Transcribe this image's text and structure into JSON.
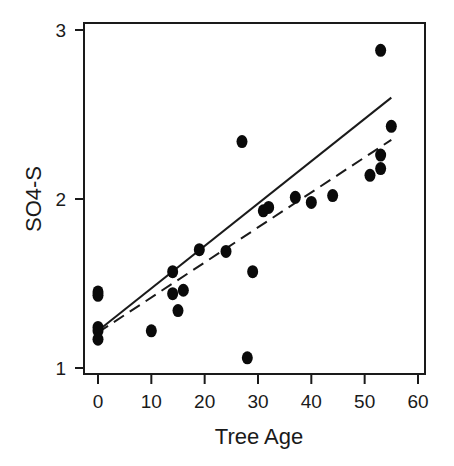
{
  "chart_data": {
    "type": "scatter",
    "title": "",
    "xlabel": "Tree Age",
    "ylabel": "SO4-S",
    "xlim": [
      -2.6,
      61.5
    ],
    "ylim": [
      0.96,
      3.04
    ],
    "xticks": [
      0,
      10,
      20,
      30,
      40,
      50,
      60
    ],
    "yticks": [
      1,
      2,
      3
    ],
    "grid": false,
    "legend": null,
    "points": [
      {
        "x": 0,
        "y": 1.45
      },
      {
        "x": 0,
        "y": 1.43
      },
      {
        "x": 0,
        "y": 1.24
      },
      {
        "x": 0,
        "y": 1.22
      },
      {
        "x": 0,
        "y": 1.17
      },
      {
        "x": 10,
        "y": 1.22
      },
      {
        "x": 14,
        "y": 1.57
      },
      {
        "x": 14,
        "y": 1.44
      },
      {
        "x": 15,
        "y": 1.34
      },
      {
        "x": 16,
        "y": 1.46
      },
      {
        "x": 19,
        "y": 1.7
      },
      {
        "x": 24,
        "y": 1.69
      },
      {
        "x": 27,
        "y": 2.34
      },
      {
        "x": 28,
        "y": 1.06
      },
      {
        "x": 29,
        "y": 1.57
      },
      {
        "x": 31,
        "y": 1.93
      },
      {
        "x": 32,
        "y": 1.95
      },
      {
        "x": 37,
        "y": 2.01
      },
      {
        "x": 40,
        "y": 1.98
      },
      {
        "x": 44,
        "y": 2.02
      },
      {
        "x": 51,
        "y": 2.14
      },
      {
        "x": 53,
        "y": 2.18
      },
      {
        "x": 53,
        "y": 2.26
      },
      {
        "x": 53,
        "y": 2.88
      },
      {
        "x": 55,
        "y": 2.43
      }
    ],
    "lines": [
      {
        "name": "solid-fit",
        "style": "solid",
        "x": [
          0,
          55
        ],
        "y": [
          1.22,
          2.6
        ]
      },
      {
        "name": "dashed-fit",
        "style": "dashed",
        "x": [
          0,
          55
        ],
        "y": [
          1.21,
          2.35
        ]
      }
    ]
  },
  "labels": {
    "xlabel": "Tree Age",
    "ylabel": "SO4-S",
    "xticks": [
      "0",
      "10",
      "20",
      "30",
      "40",
      "50",
      "60"
    ],
    "yticks": [
      "1",
      "2",
      "3"
    ]
  }
}
